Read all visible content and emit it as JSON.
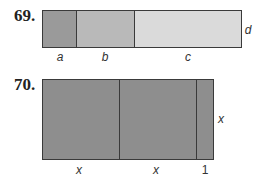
{
  "problems": [
    {
      "number": "69.",
      "segments": [
        {
          "label": "a",
          "color": "#9a9a9a"
        },
        {
          "label": "b",
          "color": "#b9b9b9"
        },
        {
          "label": "c",
          "color": "#dadada"
        }
      ],
      "side_label": "d"
    },
    {
      "number": "70.",
      "segments": [
        {
          "label": "x",
          "color": "#8e8e8e"
        },
        {
          "label": "x",
          "color": "#8e8e8e"
        },
        {
          "label": "1",
          "color": "#8e8e8e"
        }
      ],
      "side_label": "x"
    }
  ]
}
